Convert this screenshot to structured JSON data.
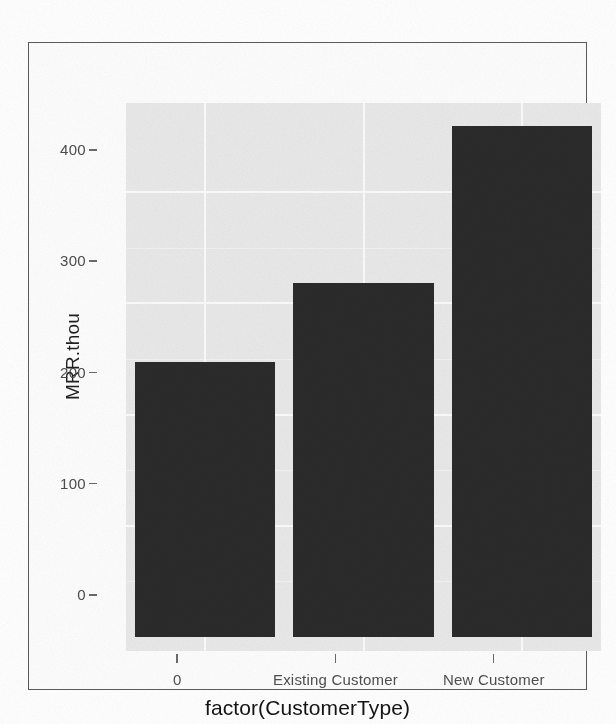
{
  "chart_data": {
    "type": "bar",
    "title": "",
    "subtitle": "",
    "xlabel": "factor(CustomerType)",
    "ylabel": "MRR.thou",
    "categories": [
      "0",
      "Existing Customer",
      "New Customer"
    ],
    "values": [
      247,
      318,
      459
    ],
    "series": [
      {
        "name": "MRR.thou",
        "values": [
          247,
          318,
          459
        ]
      }
    ],
    "ylim": [
      0,
      470
    ],
    "y_ticks": [
      0,
      100,
      200,
      300,
      400
    ],
    "y_tick_labels": [
      "0",
      "100",
      "200",
      "300",
      "400"
    ],
    "x_tick_labels": [
      "0",
      "Existing Customer",
      "New Customer"
    ],
    "grid": true,
    "legend": "none",
    "bar_color": "#2b2b2b",
    "panel_background": "#e9e9e9",
    "gridline_color": "#fbfbfb",
    "annotations": []
  },
  "figure": {
    "border_color": "#5b5b5b",
    "background": "#ffffff"
  }
}
